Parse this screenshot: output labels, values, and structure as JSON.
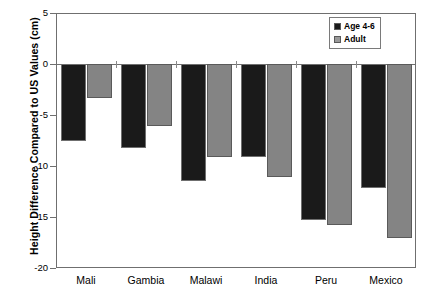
{
  "chart_data": {
    "type": "bar",
    "title": "",
    "xlabel": "",
    "ylabel": "Height Difference Compared to US Values (cm)",
    "categories": [
      "Mali",
      "Gambia",
      "Malawi",
      "India",
      "Peru",
      "Mexico"
    ],
    "series": [
      {
        "name": "Age 4-6",
        "color": "#1a1a1a",
        "values": [
          -7.5,
          -8.2,
          -11.5,
          -9.1,
          -15.3,
          -12.2
        ]
      },
      {
        "name": "Adult",
        "color": "#848484",
        "values": [
          -3.3,
          -6.1,
          -9.1,
          -11.1,
          -15.8,
          -17.1
        ]
      }
    ],
    "ylim": [
      -20,
      5
    ],
    "yticks": [
      5,
      0,
      -5,
      -10,
      -15,
      -20
    ],
    "ytick_labels": [
      "5",
      "0",
      "-5",
      "-10",
      "-15",
      "-20"
    ],
    "grid": false,
    "legend_position": "top-right",
    "legend_entries": [
      "Age 4-6",
      "Adult"
    ]
  },
  "legend": {
    "items": [
      {
        "label": "Age 4-6"
      },
      {
        "label": "Adult"
      }
    ]
  }
}
